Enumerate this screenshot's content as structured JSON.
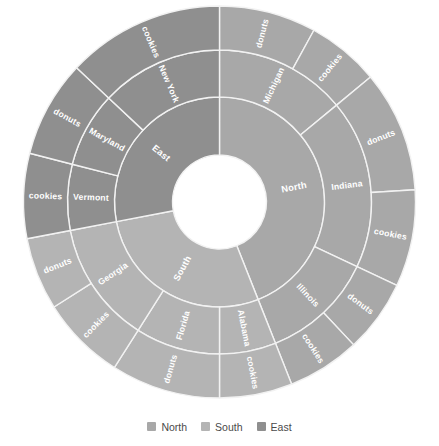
{
  "chart_data": {
    "type": "pie",
    "subtype": "sunburst",
    "title": "",
    "xlabel": "",
    "ylabel": "",
    "grid": false,
    "legend_position": "bottom",
    "levels": [
      "Region",
      "State",
      "Product"
    ],
    "center_hole_ratio": 0.24,
    "start_angle_deg": -90,
    "direction": "clockwise",
    "legend": [
      {
        "label": "North",
        "color": "#a8a8a8"
      },
      {
        "label": "South",
        "color": "#b4b4b4"
      },
      {
        "label": "East",
        "color": "#8f8f8f"
      }
    ],
    "colors": {
      "North": "#a8a8a8",
      "South": "#b4b4b4",
      "East": "#8f8f8f",
      "background": "#ffffff",
      "slice_border": "#f2f2f2",
      "label_text": "#ffffff",
      "legend_text": "#4a4a4a"
    },
    "ring1": [
      {
        "label": "North",
        "value": 44,
        "color": "#a8a8a8"
      },
      {
        "label": "South",
        "value": 28,
        "color": "#b4b4b4"
      },
      {
        "label": "East",
        "value": 28,
        "color": "#8f8f8f"
      }
    ],
    "ring2": [
      {
        "label": "Michigan",
        "parent": "North",
        "value": 14,
        "color": "#a8a8a8"
      },
      {
        "label": "Indiana",
        "parent": "North",
        "value": 18,
        "color": "#a8a8a8"
      },
      {
        "label": "Illinois",
        "parent": "North",
        "value": 12,
        "color": "#a8a8a8"
      },
      {
        "label": "Alabama",
        "parent": "South",
        "value": 6,
        "color": "#b4b4b4"
      },
      {
        "label": "Florida",
        "parent": "South",
        "value": 9,
        "color": "#b4b4b4"
      },
      {
        "label": "Georgia",
        "parent": "South",
        "value": 13,
        "color": "#b4b4b4"
      },
      {
        "label": "Vermont",
        "parent": "East",
        "value": 7,
        "color": "#8f8f8f"
      },
      {
        "label": "Maryland",
        "parent": "East",
        "value": 8,
        "color": "#8f8f8f"
      },
      {
        "label": "New York",
        "parent": "East",
        "value": 13,
        "color": "#8f8f8f"
      }
    ],
    "ring3": [
      {
        "label": "donuts",
        "parent": "Michigan",
        "value": 8,
        "color": "#a8a8a8"
      },
      {
        "label": "cookies",
        "parent": "Michigan",
        "value": 6,
        "color": "#a8a8a8"
      },
      {
        "label": "donuts",
        "parent": "Indiana",
        "value": 10,
        "color": "#a8a8a8"
      },
      {
        "label": "cookies",
        "parent": "Indiana",
        "value": 8,
        "color": "#a8a8a8"
      },
      {
        "label": "donuts",
        "parent": "Illinois",
        "value": 6,
        "color": "#a8a8a8"
      },
      {
        "label": "cookies",
        "parent": "Illinois",
        "value": 6,
        "color": "#a8a8a8"
      },
      {
        "label": "cookies",
        "parent": "Alabama",
        "value": 6,
        "color": "#b4b4b4"
      },
      {
        "label": "donuts",
        "parent": "Florida",
        "value": 9,
        "color": "#b4b4b4"
      },
      {
        "label": "cookies",
        "parent": "Georgia",
        "value": 7,
        "color": "#b4b4b4"
      },
      {
        "label": "donuts",
        "parent": "Georgia",
        "value": 6,
        "color": "#b4b4b4"
      },
      {
        "label": "cookies",
        "parent": "Vermont",
        "value": 7,
        "color": "#8f8f8f"
      },
      {
        "label": "donuts",
        "parent": "Maryland",
        "value": 8,
        "color": "#8f8f8f"
      },
      {
        "label": "cookies",
        "parent": "New York",
        "value": 13,
        "color": "#8f8f8f"
      }
    ]
  }
}
